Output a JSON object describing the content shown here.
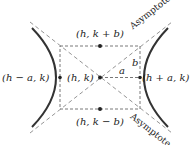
{
  "diagram": {
    "type": "hyperbola-horizontal-transverse-axis",
    "labels": {
      "top_vertex": "(h, k + b)",
      "bottom_vertex": "(h, k − b)",
      "left_vertex": "(h − a, k)",
      "center": "(h, k)",
      "right_vertex": "(h + a, k)",
      "a": "a",
      "b": "b",
      "asymptote_top": "Asymptote",
      "asymptote_bottom": "Asymptote"
    },
    "colors": {
      "curve": "#333333",
      "dashed": "#555555",
      "text": "#222222"
    }
  }
}
